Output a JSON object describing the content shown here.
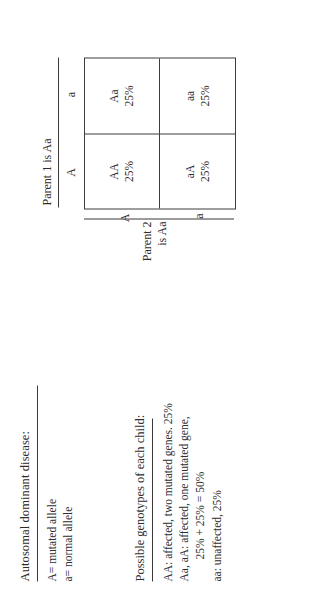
{
  "notes": {
    "title": "Autosomal dominant disease:",
    "alleles": [
      "A= mutated allele",
      "a= normal allele"
    ],
    "genotypes_title": "Possible genotypes of each child:",
    "genotypes": [
      "AA: affected, two mutated genes. 25%",
      "Aa, aA: affected, one mutated gene,",
      "25% + 25% = 50%",
      "aa: unaffected, 25%"
    ]
  },
  "punnett": {
    "parent1_label": "Parent 1 is Aa",
    "parent2_label": "Parent 2\nis Aa",
    "parent2_line1": "Parent 2",
    "parent2_line2": "is Aa",
    "column_headers": [
      "A",
      "a"
    ],
    "row_headers": [
      "A",
      "a"
    ],
    "cells": [
      {
        "genotype": "AA",
        "percent": "25%"
      },
      {
        "genotype": "Aa",
        "percent": "25%"
      },
      {
        "genotype": "aA",
        "percent": "25%"
      },
      {
        "genotype": "aa",
        "percent": "25%"
      }
    ]
  },
  "colors": {
    "ink": "#2e2e2e",
    "rule": "#3a3a3a",
    "paper": "#ffffff"
  }
}
